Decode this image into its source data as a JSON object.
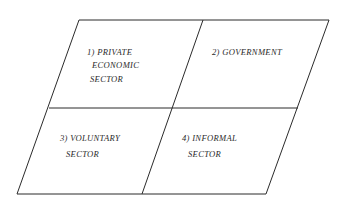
{
  "diagram": {
    "type": "quadrant-parallelogram",
    "colors": {
      "line": "#2b2b2b",
      "text": "#2a2a2a",
      "background": "#ffffff"
    },
    "quadrants": [
      {
        "id": "private",
        "position": "top-left",
        "lines": [
          "1) PRIVATE",
          "ECONOMIC",
          "SECTOR"
        ]
      },
      {
        "id": "government",
        "position": "top-right",
        "lines": [
          "2) GOVERNMENT"
        ]
      },
      {
        "id": "voluntary",
        "position": "bottom-left",
        "lines": [
          "3) VOLUNTARY",
          "SECTOR"
        ]
      },
      {
        "id": "informal",
        "position": "bottom-right",
        "lines": [
          "4) INFORMAL",
          "SECTOR"
        ]
      }
    ]
  }
}
